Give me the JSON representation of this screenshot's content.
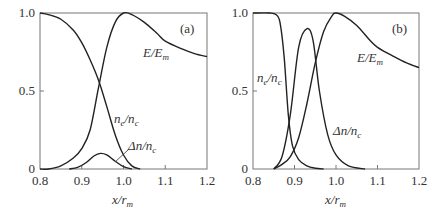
{
  "chart_data": [
    {
      "type": "line",
      "panel": "(a)",
      "xlabel": "x/r_m",
      "ylabel": "",
      "xlim": [
        0.8,
        1.2
      ],
      "ylim": [
        0,
        1.0
      ],
      "xticks": [
        "0.8",
        "0.9",
        "1.0",
        "1.1",
        "1.2"
      ],
      "yticks": [
        "0",
        "0.5",
        "1.0"
      ],
      "grid": false,
      "series": [
        {
          "name": "E/E_m",
          "x": [
            0.8,
            0.82,
            0.85,
            0.88,
            0.9,
            0.92,
            0.94,
            0.96,
            0.98,
            1.0,
            1.02,
            1.05,
            1.08,
            1.1,
            1.14,
            1.17,
            1.2
          ],
          "y": [
            0.0,
            0.0,
            0.02,
            0.07,
            0.13,
            0.25,
            0.52,
            0.78,
            0.94,
            1.0,
            0.99,
            0.94,
            0.87,
            0.82,
            0.77,
            0.74,
            0.72
          ]
        },
        {
          "name": "n_e/n_c",
          "x": [
            0.8,
            0.82,
            0.85,
            0.88,
            0.9,
            0.92,
            0.94,
            0.96,
            0.98,
            1.0,
            1.02,
            1.04
          ],
          "y": [
            1.0,
            0.99,
            0.96,
            0.89,
            0.81,
            0.7,
            0.57,
            0.4,
            0.22,
            0.09,
            0.02,
            0.0
          ]
        },
        {
          "name": "Δn/n_c",
          "x": [
            0.87,
            0.89,
            0.91,
            0.93,
            0.945,
            0.96,
            0.98,
            1.0,
            1.02
          ],
          "y": [
            0.0,
            0.01,
            0.04,
            0.085,
            0.1,
            0.09,
            0.05,
            0.015,
            0.0
          ]
        }
      ],
      "annotations": [
        "(a)",
        "E/E_m",
        "n_e/n_c",
        "Δn/n_c"
      ]
    },
    {
      "type": "line",
      "panel": "(b)",
      "xlabel": "x/r_m",
      "ylabel": "",
      "xlim": [
        0.8,
        1.2
      ],
      "ylim": [
        0,
        1.0
      ],
      "xticks": [
        "0.8",
        "0.9",
        "1.0",
        "1.1",
        "1.2"
      ],
      "yticks": [
        "0",
        "0.5",
        "1.0"
      ],
      "grid": false,
      "series": [
        {
          "name": "E/E_m",
          "x": [
            0.85,
            0.87,
            0.89,
            0.91,
            0.93,
            0.95,
            0.97,
            0.99,
            1.0,
            1.02,
            1.05,
            1.08,
            1.1,
            1.14,
            1.17,
            1.2
          ],
          "y": [
            0.0,
            0.03,
            0.08,
            0.2,
            0.42,
            0.68,
            0.88,
            0.98,
            1.0,
            0.98,
            0.92,
            0.83,
            0.78,
            0.72,
            0.68,
            0.65
          ]
        },
        {
          "name": "n_e/n_c",
          "x": [
            0.8,
            0.84,
            0.855,
            0.865,
            0.875,
            0.885,
            0.895,
            0.91,
            0.93,
            0.95,
            0.97
          ],
          "y": [
            1.0,
            1.0,
            0.99,
            0.94,
            0.72,
            0.35,
            0.15,
            0.06,
            0.02,
            0.005,
            0.0
          ]
        },
        {
          "name": "Δn/n_c",
          "x": [
            0.85,
            0.87,
            0.89,
            0.91,
            0.93,
            0.945,
            0.96,
            0.98,
            1.0,
            1.03,
            1.07
          ],
          "y": [
            0.0,
            0.08,
            0.35,
            0.78,
            0.9,
            0.82,
            0.5,
            0.22,
            0.09,
            0.02,
            0.0
          ]
        }
      ],
      "annotations": [
        "(b)",
        "E/E_m",
        "n_e/n_c",
        "Δn/n_c"
      ]
    }
  ],
  "panels": {
    "a": {
      "tag": "(a)",
      "ticks_x": [
        "0.8",
        "0.9",
        "1.0",
        "1.1",
        "1.2"
      ],
      "ticks_y": [
        "0",
        "0.5",
        "1.0"
      ],
      "label_E": "E/E",
      "label_E_sub": "m",
      "label_ne": "n",
      "label_ne_sub": "e",
      "label_ne_den": "/n",
      "label_ne_den_sub": "c",
      "label_dn": "Δn/n",
      "label_dn_sub": "c",
      "xlabel": "x/r",
      "xlabel_sub": "m"
    },
    "b": {
      "tag": "(b)",
      "ticks_x": [
        "0.8",
        "0.9",
        "1.0",
        "1.1",
        "1.2"
      ],
      "ticks_y": [
        "0",
        "0.5",
        "1.0"
      ],
      "label_E": "E/E",
      "label_E_sub": "m",
      "label_ne": "n",
      "label_ne_sub": "e",
      "label_ne_den": "/n",
      "label_ne_den_sub": "c",
      "label_dn": "Δn/n",
      "label_dn_sub": "c",
      "xlabel": "x/r",
      "xlabel_sub": "m"
    }
  }
}
